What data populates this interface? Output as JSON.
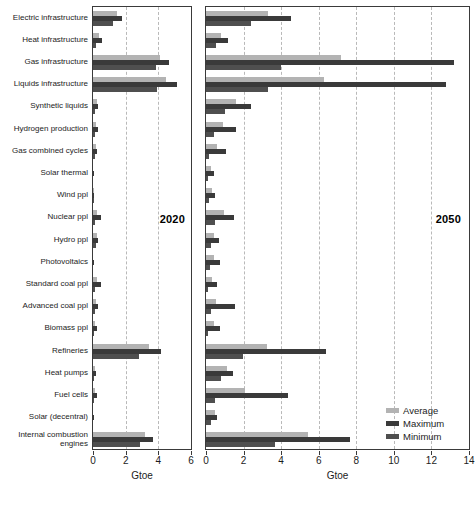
{
  "chart_data": {
    "type": "bar",
    "title": "",
    "xlabel": "Gtoe",
    "ylabel": "",
    "orientation": "horizontal",
    "grid": true,
    "legend_position": "bottom-right",
    "legend": [
      "Average",
      "Maximum",
      "Minimum"
    ],
    "series_colors": {
      "average": "#b3b3b3",
      "maximum": "#3a3a3a",
      "minimum": "#4f4f4f"
    },
    "categories": [
      "Electric infrastructure",
      "Heat infrastructure",
      "Gas infrastructure",
      "Liquids infrastructure",
      "Synthetic liquids",
      "Hydrogen production",
      "Gas combined cycles",
      "Solar thermal",
      "Wind ppl",
      "Nuclear ppl",
      "Hydro ppl",
      "Photovoltaics",
      "Standard coal ppl",
      "Advanced coal ppl",
      "Biomass ppl",
      "Refineries",
      "Heat pumps",
      "Fuel cells",
      "Solar (decentral)",
      "Internal combustion\nengines"
    ],
    "panels": [
      {
        "name": "2020",
        "label": "2020",
        "xlim": [
          0,
          6
        ],
        "xticks": [
          0,
          2,
          4,
          6
        ],
        "xticklabels": [
          "0",
          "2",
          "4",
          "6"
        ],
        "series": [
          {
            "name": "Average",
            "values": [
              1.45,
              0.34,
              4.1,
              4.45,
              0.22,
              0.2,
              0.18,
              0.0,
              0.04,
              0.22,
              0.24,
              0.0,
              0.22,
              0.16,
              0.14,
              3.45,
              0.1,
              0.11,
              0.0,
              3.2
            ]
          },
          {
            "name": "Maximum",
            "values": [
              1.75,
              0.55,
              4.65,
              5.15,
              0.28,
              0.3,
              0.22,
              0.02,
              0.05,
              0.5,
              0.3,
              0.03,
              0.5,
              0.3,
              0.22,
              4.15,
              0.16,
              0.22,
              0.03,
              3.7
            ]
          },
          {
            "name": "Minimum",
            "values": [
              1.2,
              0.18,
              3.85,
              3.9,
              0.12,
              0.14,
              0.1,
              0.0,
              0.03,
              0.14,
              0.18,
              0.0,
              0.14,
              0.1,
              0.08,
              2.8,
              0.06,
              0.05,
              0.0,
              2.85
            ]
          }
        ]
      },
      {
        "name": "2050",
        "label": "2050",
        "xlim": [
          0,
          14
        ],
        "xticks": [
          0,
          2,
          4,
          6,
          8,
          10,
          12,
          14
        ],
        "xticklabels": [
          "0",
          "2",
          "4",
          "6",
          "8",
          "10",
          "12",
          "14"
        ],
        "series": [
          {
            "name": "Average",
            "values": [
              3.3,
              0.8,
              7.2,
              6.3,
              1.6,
              0.9,
              0.6,
              0.25,
              0.3,
              0.95,
              0.45,
              0.45,
              0.3,
              0.55,
              0.4,
              3.25,
              1.1,
              2.1,
              0.5,
              5.45
            ]
          },
          {
            "name": "Maximum",
            "values": [
              4.55,
              1.15,
              13.2,
              12.8,
              2.4,
              1.6,
              1.05,
              0.4,
              0.5,
              1.5,
              0.7,
              0.75,
              0.6,
              1.55,
              0.75,
              6.4,
              1.45,
              4.35,
              0.6,
              7.65
            ]
          },
          {
            "name": "Minimum",
            "values": [
              2.4,
              0.55,
              4.0,
              3.3,
              1.0,
              0.45,
              0.15,
              0.1,
              0.15,
              0.5,
              0.25,
              0.2,
              0.1,
              0.25,
              0.1,
              1.95,
              0.8,
              0.5,
              0.25,
              3.65
            ]
          }
        ]
      }
    ]
  }
}
